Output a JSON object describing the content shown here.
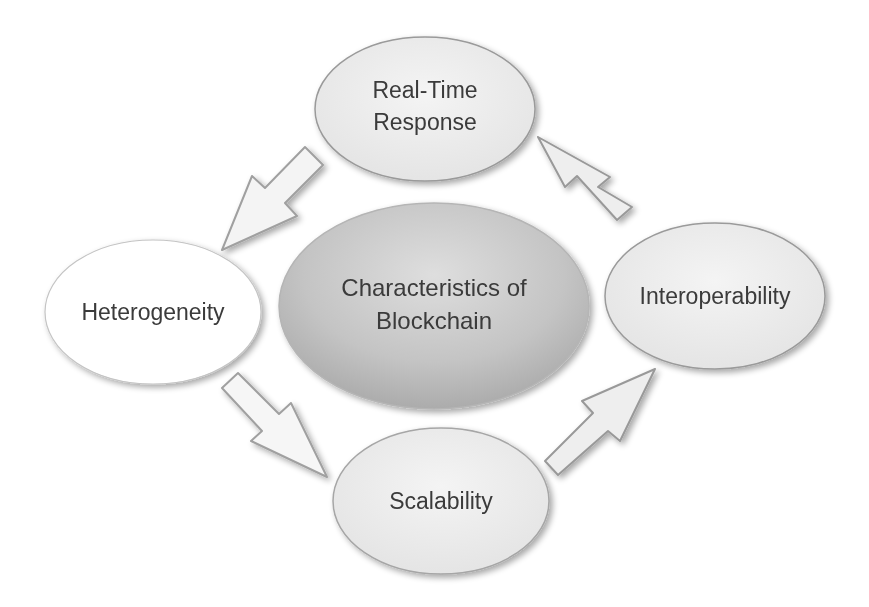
{
  "diagram": {
    "title": "Characteristics of Blockchain",
    "center": {
      "line1": "Characteristics of",
      "line2": "Blockchain"
    },
    "nodes": [
      {
        "id": "real-time-response",
        "line1": "Real-Time",
        "line2": "Response",
        "position": "top"
      },
      {
        "id": "interoperability",
        "line1": "Interoperability",
        "position": "right"
      },
      {
        "id": "scalability",
        "line1": "Scalability",
        "position": "bottom"
      },
      {
        "id": "heterogeneity",
        "line1": "Heterogeneity",
        "position": "left"
      }
    ],
    "arrows": [
      {
        "from": "real-time-response",
        "to": "heterogeneity",
        "direction": "down-left"
      },
      {
        "from": "heterogeneity",
        "to": "scalability",
        "direction": "down-right"
      },
      {
        "from": "scalability",
        "to": "interoperability",
        "direction": "up-right"
      },
      {
        "from": "interoperability",
        "to": "real-time-response",
        "direction": "up-left"
      }
    ],
    "colors": {
      "center_top": "#dcdcdc",
      "center_bottom": "#a8a8a8",
      "node_fill": "#ececec",
      "heterogeneity_fill": "#ffffff",
      "outline": "#9a9a9a",
      "text": "#3a3a3a",
      "arrow_fill": "#f2f2f2"
    }
  }
}
